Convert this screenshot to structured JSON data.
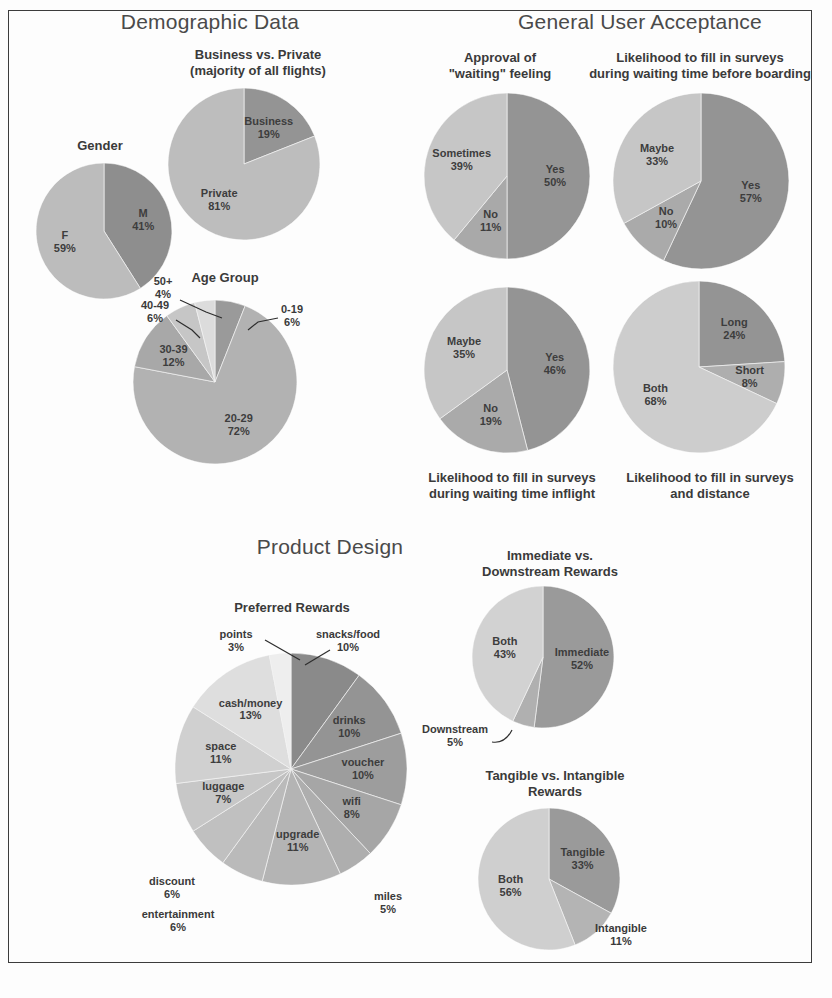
{
  "poster": {
    "background_color": "#fdfdfd",
    "frame_color": "#3c3c3c"
  },
  "sections": {
    "demographic": "Demographic Data",
    "acceptance": "General User Acceptance",
    "product": "Product Design"
  },
  "titles": {
    "gender": "Gender",
    "business_private": "Business vs. Private\n(majority of all flights)",
    "age_group": "Age Group",
    "approval_waiting": "Approval of\n\"waiting\" feeling",
    "surveys_boarding": "Likelihood to fill in surveys\nduring waiting time before boarding",
    "surveys_inflight": "Likelihood to fill in surveys\nduring waiting time inflight",
    "surveys_distance": "Likelihood to fill in surveys\nand distance",
    "preferred_rewards": "Preferred Rewards",
    "immediate_downstream": "Immediate vs.\nDownstream Rewards",
    "tangible_intangible": "Tangible vs. Intangible\nRewards"
  },
  "palette": {
    "dark": "#8e8e8e",
    "mid": "#a3a3a3",
    "light": "#b8b8b8",
    "lighter": "#c9c9c9",
    "lightest": "#dcdcdc",
    "near_white": "#ebebeb",
    "text": "#3d3d3d"
  },
  "chart_data": [
    {
      "id": "gender",
      "type": "pie",
      "title": "Gender",
      "categories": [
        "M",
        "F"
      ],
      "values": [
        41,
        59
      ],
      "labels": [
        "M\n41%",
        "F\n59%"
      ],
      "colors": [
        "#8e8e8e",
        "#bcbcbc"
      ],
      "unit": "%"
    },
    {
      "id": "business-private",
      "type": "pie",
      "title": "Business vs. Private (majority of all flights)",
      "categories": [
        "Business",
        "Private"
      ],
      "values": [
        19,
        81
      ],
      "labels": [
        "Business\n19%",
        "Private\n81%"
      ],
      "colors": [
        "#949494",
        "#bdbdbd"
      ],
      "unit": "%"
    },
    {
      "id": "age-group",
      "type": "pie",
      "title": "Age Group",
      "categories": [
        "0-19",
        "20-29",
        "30-39",
        "40-49",
        "50+"
      ],
      "values": [
        6,
        72,
        12,
        6,
        4
      ],
      "labels": [
        "0-19\n6%",
        "20-29\n72%",
        "30-39\n12%",
        "40-49\n6%",
        "50+\n4%"
      ],
      "colors": [
        "#9a9a9a",
        "#b2b2b2",
        "#a8a8a8",
        "#c6c6c6",
        "#dcdcdc"
      ],
      "unit": "%"
    },
    {
      "id": "approval-waiting",
      "type": "pie",
      "title": "Approval of \"waiting\" feeling",
      "categories": [
        "Yes",
        "No",
        "Sometimes"
      ],
      "values": [
        50,
        11,
        39
      ],
      "labels": [
        "Yes\n50%",
        "No\n11%",
        "Sometimes\n39%"
      ],
      "colors": [
        "#949494",
        "#a9a9a9",
        "#c6c6c6"
      ],
      "unit": "%"
    },
    {
      "id": "surveys-boarding",
      "type": "pie",
      "title": "Likelihood to fill in surveys during waiting time before boarding",
      "categories": [
        "Yes",
        "No",
        "Maybe"
      ],
      "values": [
        57,
        10,
        33
      ],
      "labels": [
        "Yes\n57%",
        "No\n10%",
        "Maybe\n33%"
      ],
      "colors": [
        "#949494",
        "#aaaaaa",
        "#c6c6c6"
      ],
      "unit": "%"
    },
    {
      "id": "surveys-inflight",
      "type": "pie",
      "title": "Likelihood to fill in surveys during waiting time inflight",
      "categories": [
        "Yes",
        "No",
        "Maybe"
      ],
      "values": [
        46,
        19,
        35
      ],
      "labels": [
        "Yes\n46%",
        "No\n19%",
        "Maybe\n35%"
      ],
      "colors": [
        "#949494",
        "#aaaaaa",
        "#c6c6c6"
      ],
      "unit": "%"
    },
    {
      "id": "surveys-distance",
      "type": "pie",
      "title": "Likelihood to fill in surveys and distance",
      "categories": [
        "Long",
        "Short",
        "Both"
      ],
      "values": [
        24,
        8,
        68
      ],
      "labels": [
        "Long\n24%",
        "Short\n8%",
        "Both\n68%"
      ],
      "colors": [
        "#949494",
        "#aeaeae",
        "#cdcdcd"
      ],
      "unit": "%"
    },
    {
      "id": "preferred-rewards",
      "type": "pie",
      "title": "Preferred Rewards",
      "categories": [
        "snacks/food",
        "drinks",
        "voucher",
        "wifi",
        "miles",
        "upgrade",
        "entertainment",
        "discount",
        "luggage",
        "space",
        "cash/money",
        "points"
      ],
      "values": [
        10,
        10,
        10,
        8,
        5,
        11,
        6,
        6,
        7,
        11,
        13,
        3
      ],
      "labels": [
        "snacks/food\n10%",
        "drinks\n10%",
        "voucher\n10%",
        "wifi\n8%",
        "miles\n5%",
        "upgrade\n11%",
        "entertainment\n6%",
        "discount\n6%",
        "luggage\n7%",
        "space\n11%",
        "cash/money\n13%",
        "points\n3%"
      ],
      "colors": [
        "#8a8a8a",
        "#949494",
        "#9d9d9d",
        "#a6a6a6",
        "#aeaeae",
        "#b4b4b4",
        "#bababa",
        "#c0c0c0",
        "#c7c7c7",
        "#d0d0d0",
        "#dedede",
        "#eeeeee"
      ],
      "unit": "%"
    },
    {
      "id": "immediate-downstream",
      "type": "pie",
      "title": "Immediate vs. Downstream Rewards",
      "categories": [
        "Immediate",
        "Downstream",
        "Both"
      ],
      "values": [
        52,
        5,
        43
      ],
      "labels": [
        "Immediate\n52%",
        "Downstream\n5%",
        "Both\n43%"
      ],
      "colors": [
        "#9a9a9a",
        "#b0b0b0",
        "#d2d2d2"
      ],
      "unit": "%"
    },
    {
      "id": "tangible-intangible",
      "type": "pie",
      "title": "Tangible vs. Intangible Rewards",
      "categories": [
        "Tangible",
        "Intangible",
        "Both"
      ],
      "values": [
        33,
        11,
        56
      ],
      "labels": [
        "Tangible\n33%",
        "Intangible\n11%",
        "Both\n56%"
      ],
      "colors": [
        "#9a9a9a",
        "#b4b4b4",
        "#cfcfcf"
      ],
      "unit": "%"
    }
  ]
}
